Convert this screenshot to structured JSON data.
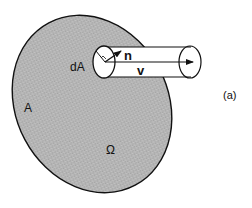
{
  "diagram": {
    "labels": {
      "area": "A",
      "area_element": "dA",
      "normal_vector": "n",
      "velocity_vector": "v",
      "region": "Ω",
      "panel": "(a)"
    },
    "colors": {
      "surface_fill": "#b4b4b4",
      "stroke": "#111111",
      "tube_fill": "#ffffff",
      "background": "#ffffff"
    }
  }
}
